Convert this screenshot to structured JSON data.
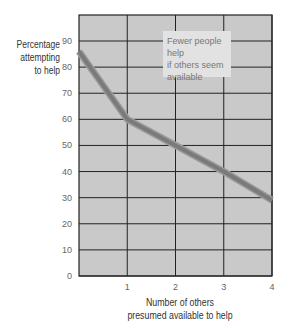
{
  "chart_data": {
    "type": "line",
    "title": "",
    "xlabel": "Number of others presumed available to help",
    "ylabel": "Percentage attempting to help",
    "x": [
      0,
      1,
      2,
      3,
      4
    ],
    "series": [
      {
        "name": "Percentage attempting to help",
        "values": [
          86,
          60,
          50,
          40,
          29
        ]
      }
    ],
    "xticks": [
      "1",
      "2",
      "3",
      "4"
    ],
    "yticks": [
      "0",
      "10",
      "20",
      "30",
      "40",
      "50",
      "60",
      "70",
      "80",
      "90"
    ],
    "xlim": [
      0,
      4
    ],
    "ylim": [
      0,
      100
    ],
    "grid": true,
    "legend": null,
    "annotations": [
      "Fewer people help if others seem available"
    ],
    "colors": {
      "plot_bg": "#c9c9c9",
      "line": "#7a7a7a",
      "grid": "#222222"
    }
  },
  "labels": {
    "ylabel_line1": "Percentage",
    "ylabel_line2": "attempting",
    "ylabel_line3": "to help",
    "xlabel_line1": "Number of others",
    "xlabel_line2": "presumed available to help",
    "annotation_line1": "Fewer people help",
    "annotation_line2": "if others seem",
    "annotation_line3": "available"
  }
}
